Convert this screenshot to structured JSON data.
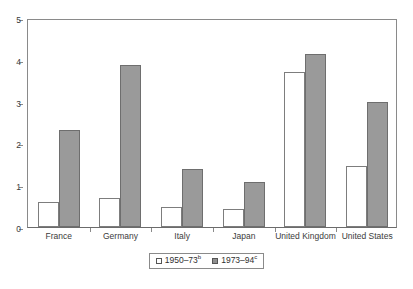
{
  "chart_data": {
    "type": "bar",
    "title": "",
    "subtitle": "",
    "xlabel": "",
    "ylabel": "",
    "ylim": [
      0,
      5
    ],
    "yticks": [
      "0",
      "1",
      "2",
      "3",
      "4",
      "5"
    ],
    "grid": false,
    "legend_position": "bottom-center",
    "categories": [
      "France",
      "Germany",
      "Italy",
      "Japan",
      "United Kingdom",
      "United States"
    ],
    "series": [
      {
        "name": "1950–73",
        "name_superscript": "b",
        "style": "white-fill",
        "color": "#ffffff",
        "border_color": "#7d7d7d",
        "values": [
          0.6,
          0.69,
          0.48,
          0.44,
          3.72,
          1.45
        ]
      },
      {
        "name": "1973–94",
        "name_superscript": "c",
        "style": "gray-fill",
        "color": "#9a9a9a",
        "border_color": "#6e6e6e",
        "values": [
          2.33,
          3.87,
          1.39,
          1.07,
          4.13,
          2.98
        ]
      }
    ]
  },
  "legend": {
    "items": [
      {
        "label": "1950–73",
        "sup": "b",
        "swatch": "white-square"
      },
      {
        "label": "1973–94",
        "sup": "c",
        "swatch": "gray-square"
      }
    ]
  }
}
